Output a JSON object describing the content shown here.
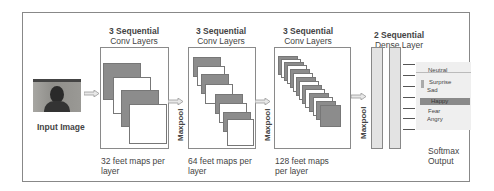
{
  "diagram": {
    "input": {
      "label": "Input Image"
    },
    "blocks": [
      {
        "title_line1": "3 Sequential",
        "title_line2": "Conv Layers",
        "caption_line1": "32 feet maps per",
        "caption_line2": "layer",
        "feature_map_count": 4
      },
      {
        "title_line1": "3 Sequential",
        "title_line2": "Conv Layers",
        "caption_line1": "64 feet maps per",
        "caption_line2": "layer",
        "feature_map_count": 8
      },
      {
        "title_line1": "3 Sequential",
        "title_line2": "Conv Layers",
        "caption_line1": "128 feet maps",
        "caption_line2": "per layer",
        "feature_map_count": 14
      }
    ],
    "pool_labels": [
      "Maxpool",
      "Maxpool",
      "Maxpool"
    ],
    "dense": {
      "title_line1": "2 Sequential",
      "title_line2": "Dense Layer",
      "count": 2
    },
    "softmax": {
      "classes": [
        "Neutral",
        "Surprise",
        "Sad",
        "Happy",
        "Fear",
        "Angry"
      ],
      "highlighted": "Happy",
      "caption_line1": "Softmax",
      "caption_line2": "Output"
    },
    "colors": {
      "dark_map": "#8c8c8c",
      "border": "#888888",
      "highlight": "#8a8a8a"
    }
  }
}
